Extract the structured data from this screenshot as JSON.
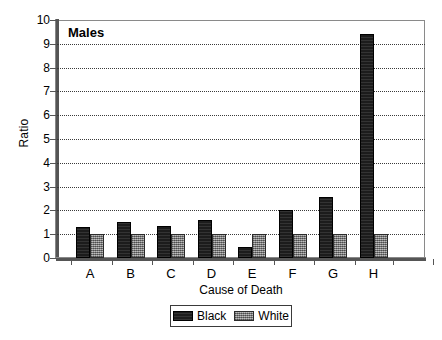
{
  "chart_data": {
    "type": "bar",
    "title": "Males",
    "xlabel": "Cause of Death",
    "ylabel": "Ratio",
    "categories": [
      "A",
      "B",
      "C",
      "D",
      "E",
      "F",
      "G",
      "H"
    ],
    "series": [
      {
        "name": "Black",
        "values": [
          1.3,
          1.5,
          1.35,
          1.6,
          0.45,
          2.0,
          2.55,
          9.4
        ]
      },
      {
        "name": "White",
        "values": [
          1.0,
          1.0,
          1.0,
          1.0,
          1.0,
          1.0,
          1.0,
          1.0
        ]
      }
    ],
    "ylim": [
      0,
      10
    ],
    "yticks": [
      0,
      1,
      2,
      3,
      4,
      5,
      6,
      7,
      8,
      9,
      10
    ],
    "ytick_labels": [
      "0",
      "1",
      "2",
      "3",
      "4",
      "5",
      "6",
      "7",
      "8",
      "9",
      "10"
    ],
    "grid": true,
    "grid_axis": "y",
    "legend_position": "below-center",
    "colors": {
      "black_series": "#1c1c1c",
      "white_series": "#8e8e8e",
      "axis": "#555555",
      "gridline": "#3a3a3a",
      "background": "#ffffff"
    }
  }
}
